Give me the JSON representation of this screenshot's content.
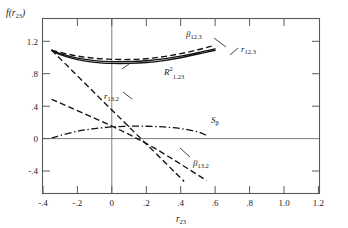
{
  "figure": {
    "ylabel": "f(r23)",
    "ylabel_main": "f(r",
    "ylabel_sub": "23",
    "ylabel_close": ")",
    "xlabel_main": "r",
    "xlabel_sub": "23"
  },
  "chart_data": {
    "type": "line",
    "title": "",
    "xlabel": "r23",
    "ylabel": "f(r23)",
    "xlim": [
      -0.4,
      1.2
    ],
    "ylim": [
      -0.6,
      1.35
    ],
    "grid": false,
    "legend": "inline-annotations",
    "xticks": [
      -0.4,
      -0.2,
      0,
      0.2,
      0.4,
      0.6,
      0.8,
      1.0,
      1.2
    ],
    "xticklabels": [
      "-.4",
      "-.2",
      "0",
      ".2",
      ".4",
      ".6",
      ".8",
      "1.0",
      "1.2"
    ],
    "yticks": [
      1.2,
      0.8,
      0.4,
      0,
      -0.4
    ],
    "yticklabels": [
      "1.2",
      ".8",
      ".4",
      "0",
      "-.4"
    ],
    "series": [
      {
        "name": "beta12.3",
        "label": "β",
        "label_sub": "12.3",
        "style": "dashed",
        "x": [
          -0.35,
          -0.3,
          -0.2,
          -0.1,
          0.0,
          0.1,
          0.2,
          0.3,
          0.4,
          0.5,
          0.58
        ],
        "values": [
          1.0,
          0.975,
          0.935,
          0.91,
          0.898,
          0.896,
          0.905,
          0.928,
          0.962,
          1.005,
          1.045
        ]
      },
      {
        "name": "r12.3",
        "label": "r",
        "label_sub": "12.3",
        "style": "solid",
        "x": [
          -0.35,
          -0.3,
          -0.2,
          -0.1,
          0.0,
          0.1,
          0.2,
          0.3,
          0.4,
          0.5,
          0.6
        ],
        "values": [
          1.0,
          0.962,
          0.912,
          0.884,
          0.872,
          0.872,
          0.882,
          0.903,
          0.934,
          0.972,
          1.015
        ]
      },
      {
        "name": "R2_1.23",
        "label": "R",
        "label_sup": "2",
        "label_sub": "1.23",
        "style": "solid",
        "x": [
          -0.35,
          -0.3,
          -0.2,
          -0.1,
          0.0,
          0.1,
          0.2,
          0.3,
          0.4,
          0.5,
          0.6
        ],
        "values": [
          1.0,
          0.95,
          0.895,
          0.864,
          0.852,
          0.852,
          0.862,
          0.884,
          0.916,
          0.958,
          1.0
        ]
      },
      {
        "name": "r13.2",
        "label": "r",
        "label_sub": "13.2",
        "style": "dashed",
        "x": [
          -0.35,
          0.0,
          0.2,
          0.42
        ],
        "values": [
          1.0,
          0.33,
          -0.05,
          -0.47
        ]
      },
      {
        "name": "beta13.2",
        "label": "β",
        "label_sub": "13.2",
        "style": "dashed",
        "x": [
          -0.35,
          0.0,
          0.25,
          0.55
        ],
        "values": [
          0.45,
          0.15,
          -0.1,
          -0.46
        ]
      },
      {
        "name": "S_beta",
        "label": "S",
        "label_sub": "β",
        "style": "dash-dot",
        "x": [
          -0.35,
          -0.3,
          -0.2,
          -0.1,
          0.0,
          0.1,
          0.2,
          0.3,
          0.4,
          0.5,
          0.55
        ],
        "values": [
          0.015,
          0.045,
          0.092,
          0.122,
          0.14,
          0.148,
          0.148,
          0.14,
          0.122,
          0.085,
          0.045
        ]
      }
    ],
    "annotations": [
      {
        "name": "beta12.3-label",
        "text": "β12.3",
        "x": 0.46,
        "y": 1.24
      },
      {
        "name": "r12.3-label",
        "text": "r12.3",
        "x": 0.63,
        "y": 1.13
      },
      {
        "name": "R2-1.23-label",
        "text": "R²1.23",
        "x": 0.05,
        "y": 0.7
      },
      {
        "name": "r13.2-label",
        "text": "r13.2",
        "x": -0.02,
        "y": 0.5
      },
      {
        "name": "S-beta-label",
        "text": "Sβ",
        "x": 0.3,
        "y": 0.25
      },
      {
        "name": "beta13.2-label",
        "text": "β13.2",
        "x": 0.3,
        "y": -0.21
      }
    ]
  }
}
